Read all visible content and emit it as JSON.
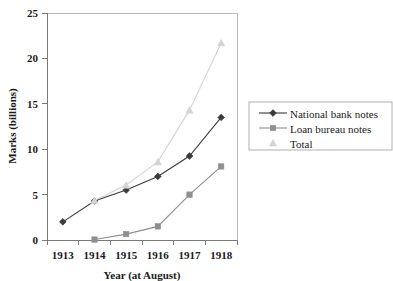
{
  "chart_data": {
    "type": "line",
    "title": "",
    "xlabel": "Year (at August)",
    "ylabel": "Marks (billions)",
    "x": [
      1913,
      1914,
      1915,
      1916,
      1917,
      1918
    ],
    "categories": [
      "1913",
      "1914",
      "1915",
      "1916",
      "1917",
      "1918"
    ],
    "xtick_labels": [
      "1913",
      "1914",
      "1915",
      "1916",
      "1917",
      "1918"
    ],
    "ytick_labels": [
      "0",
      "5",
      "10",
      "15",
      "20",
      "25"
    ],
    "yticks": [
      0,
      5,
      10,
      15,
      20,
      25
    ],
    "ylim": [
      0,
      25
    ],
    "grid": false,
    "legend_position": "right",
    "series": [
      {
        "name": "National bank notes",
        "color": "#3b3b3b",
        "marker": "diamond",
        "values": [
          2.0,
          4.3,
          5.5,
          7.0,
          9.25,
          13.5
        ]
      },
      {
        "name": "Loan bureau notes",
        "color": "#8f8f8f",
        "marker": "square",
        "values": [
          null,
          0.05,
          0.65,
          1.5,
          5.0,
          8.1
        ]
      },
      {
        "name": "Total",
        "color": "#d4d4d4",
        "marker": "triangle",
        "values": [
          null,
          4.35,
          6.05,
          8.6,
          14.3,
          21.7
        ]
      }
    ]
  },
  "axes": {
    "y_title": "Marks (billions)",
    "x_title": "Year (at August)"
  },
  "legend": {
    "items": [
      {
        "label": "National bank notes"
      },
      {
        "label": "Loan bureau notes"
      },
      {
        "label": "Total"
      }
    ]
  }
}
